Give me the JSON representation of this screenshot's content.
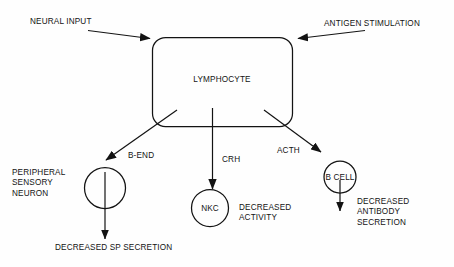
{
  "diagram": {
    "title": "LYMPHOCYTE",
    "inputs": [
      {
        "id": "neural-input",
        "label": "NEURAL INPUT"
      },
      {
        "id": "antigen-stimulation",
        "label": "ANTIGEN STIMULATION"
      }
    ],
    "center_node": {
      "id": "lymphocyte",
      "label": "LYMPHOCYTE",
      "shape": "rounded-rectangle"
    },
    "mediators": [
      {
        "id": "b-end",
        "label": "B-END"
      },
      {
        "id": "crh",
        "label": "CRH"
      },
      {
        "id": "acth",
        "label": "ACTH"
      }
    ],
    "targets": [
      {
        "id": "peripheral-sensory-neuron",
        "label": "PERIPHERAL\nSENSORY\nNEURON",
        "shape": "circle",
        "circle_label": "",
        "outcome": "DECREASED SP SECRETION"
      },
      {
        "id": "natural-killer-cell",
        "label": "",
        "shape": "circle",
        "circle_label": "NKC",
        "outcome": "DECREASED\nACTIVITY"
      },
      {
        "id": "b-cell",
        "label": "",
        "shape": "circle",
        "circle_label": "B CELL",
        "outcome": "DECREASED\nANTIBODY\nSECRETION"
      }
    ],
    "colors": {
      "stroke": "#131313",
      "text": "#131313",
      "background": "#fefefe"
    }
  }
}
